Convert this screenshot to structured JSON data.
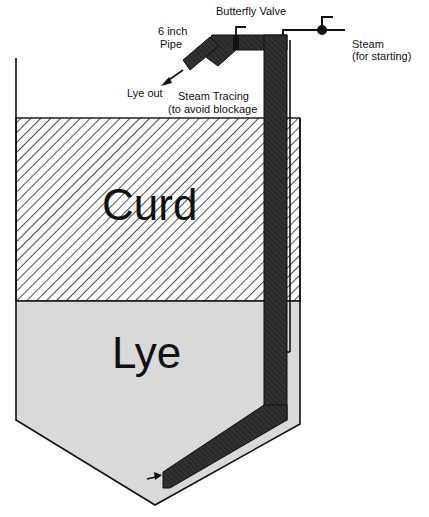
{
  "diagram": {
    "title": "",
    "regions": {
      "curd": "Curd",
      "lye": "Lye"
    },
    "labels": {
      "butterfly_valve": "Butterfly Valve",
      "pipe_line1": "6 inch",
      "pipe_line2": "Pipe",
      "lye_out": "Lye out",
      "steam_tracing_line1": "Steam Tracing",
      "steam_tracing_line2": "(to avoid blockage",
      "steam_line1": "Steam",
      "steam_line2": "(for starting)"
    },
    "colors": {
      "outline": "#111111",
      "pipe_fill": "#2a2a2a",
      "lye_fill": "#d9d9d9",
      "hatch": "#222222",
      "background": "#ffffff"
    }
  }
}
